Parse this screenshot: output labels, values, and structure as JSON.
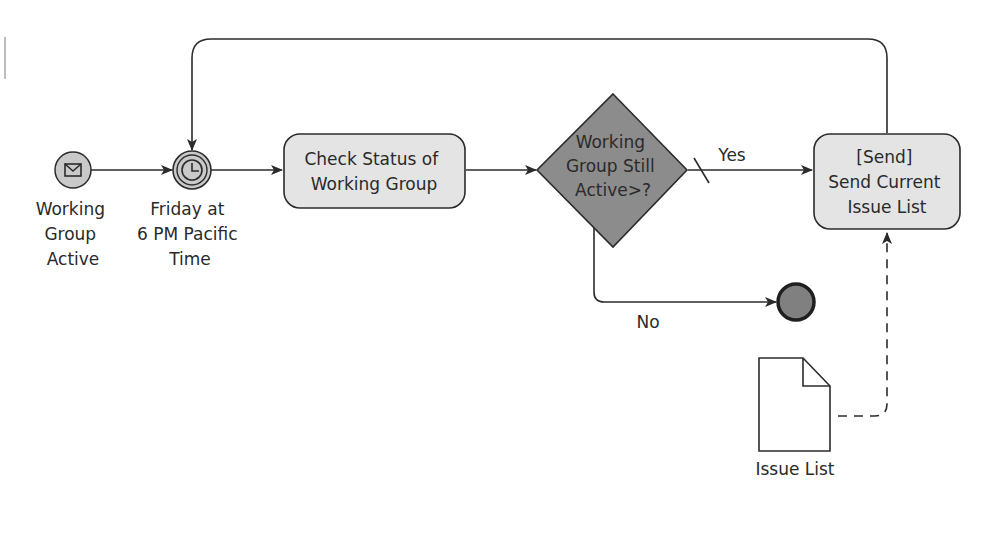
{
  "diagram": {
    "type": "BPMN process",
    "colors": {
      "stroke": "#2b2b2b",
      "event_fill": "#c9c9c9",
      "task_fill": "#e4e4e4",
      "gateway_fill": "#8c8c8c",
      "end_fill": "#808080",
      "text": "#2a2a2a",
      "background": "#ffffff"
    },
    "start_event": {
      "kind": "message-start-event",
      "icon": "envelope-icon",
      "label_lines": [
        "Working",
        "Group",
        "Active"
      ]
    },
    "timer_event": {
      "kind": "timer-intermediate-event",
      "icon": "clock-icon",
      "label_lines": [
        "Friday at",
        "6 PM Pacific",
        "Time"
      ]
    },
    "task_check": {
      "kind": "task",
      "label_lines": [
        "Check Status of",
        "Working Group"
      ]
    },
    "gateway": {
      "kind": "exclusive-gateway",
      "label_lines": [
        "Working",
        "Group Still",
        "Active>?"
      ]
    },
    "task_send": {
      "kind": "send-task",
      "label_lines": [
        "[Send]",
        "Send Current",
        "Issue List"
      ]
    },
    "end_event": {
      "kind": "end-event"
    },
    "data_object": {
      "kind": "data-object",
      "icon": "document-icon",
      "label": "Issue List"
    },
    "flows": {
      "yes_label": "Yes",
      "no_label": "No"
    }
  }
}
